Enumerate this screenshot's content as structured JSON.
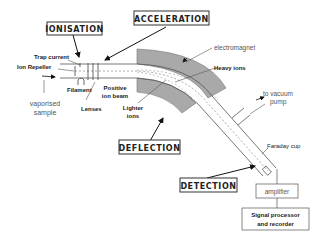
{
  "diagram": {
    "stages": {
      "ionisation": "IONISATION",
      "acceleration": "ACCELERATION",
      "deflection": "DEFLECTION",
      "detection": "DETECTION"
    },
    "labels": {
      "trap_current": "Trap current",
      "ion_repeller": "Ion Repeller",
      "vaporised_sample_line1": "vaporised",
      "vaporised_sample_line2": "sample",
      "filament": "Filament",
      "lenses": "Lenses",
      "positive_ion_beam_line1": "Positive",
      "positive_ion_beam_line2": "ion beam",
      "lighter_ions_line1": "Lighter",
      "lighter_ions_line2": "ions",
      "electromagnet": "electromagnet",
      "heavy_ions": "Heavy ions",
      "to_vacuum_pump_line1": "to vacuum",
      "to_vacuum_pump_line2": "pump",
      "faraday_cup": "Faraday cup"
    },
    "boxes": {
      "amplifier": "amplifier",
      "signal_processor_line1": "Signal processor",
      "signal_processor_line2": "and recorder"
    },
    "colors": {
      "magnet_fill": "#a9a9a9",
      "line": "#444444",
      "text": "#222222"
    }
  }
}
